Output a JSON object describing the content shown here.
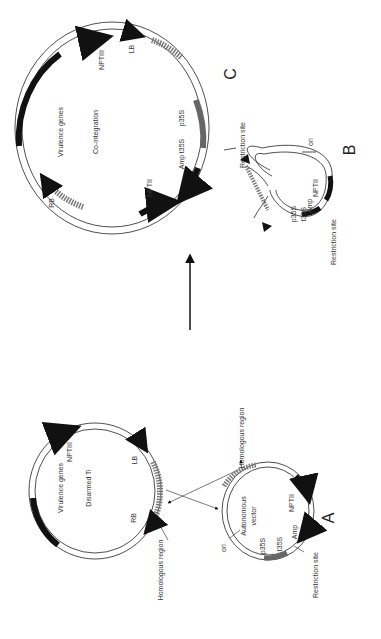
{
  "figure": {
    "orientation": "rotated 90deg counter-clockwise",
    "arrow_direction": "A to C (co-integration)",
    "colors": {
      "line": "#222222",
      "gene_block": "#111111",
      "promoter": "#666666",
      "homologous": "#777777",
      "background": "#ffffff"
    }
  },
  "plasmids": {
    "ti": {
      "name": "Disarmed Ti",
      "labels": {
        "center": "Disarmed Ti",
        "virulence": "Virulence genes",
        "nptiii": "NPTIII",
        "lb": "LB",
        "rb": "RB",
        "homologous": "Homologous region"
      }
    },
    "a": {
      "panel": "A",
      "name": "Autonomous vector",
      "labels": {
        "center1": "Autonomous",
        "center2": "vector",
        "ori": "ori",
        "p35s": "p35S",
        "t35s": "t35S",
        "amp": "Amp",
        "nptii": "NPTII",
        "restriction": "Restriction site",
        "homologous": "Homologous region"
      }
    },
    "b": {
      "panel": "B",
      "labels": {
        "ori": "ori",
        "p35s": "p35S",
        "t35s": "t35S",
        "amp": "Amp",
        "nptii": "NPTII",
        "restriction": "Restriction site"
      }
    },
    "c": {
      "panel": "C",
      "name": "Co-integration",
      "labels": {
        "center": "Co-integration",
        "virulence": "Virulence genes",
        "nptiii": "NPTIII",
        "lb": "LB",
        "rb": "RB",
        "nptii": "NPTII",
        "amp": "Amp",
        "t35s": "t35S",
        "p35s": "p35S",
        "restriction": "Restriction site"
      }
    }
  }
}
